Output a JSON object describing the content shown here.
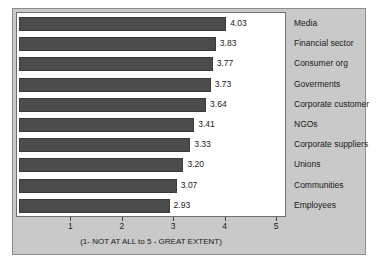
{
  "chart_data": {
    "type": "bar",
    "orientation": "horizontal",
    "title": "",
    "xlabel": "(1- NOT AT ALL to 5 - GREAT EXTENT)",
    "ylabel": "",
    "xlim": [
      0,
      5
    ],
    "xticks": [
      "1",
      "2",
      "3",
      "4",
      "5"
    ],
    "grid": false,
    "legend": null,
    "bar_color": "#4c4c4c",
    "plot_background": "#ffffff",
    "figure_background": "#c9c9c9",
    "categories": [
      "Media",
      "Financial sector",
      "Consumer org",
      "Goverments",
      "Corporate customer",
      "NGOs",
      "Corporate suppliers",
      "Unions",
      "Communities",
      "Employees"
    ],
    "values": [
      4.03,
      3.83,
      3.77,
      3.73,
      3.64,
      3.41,
      3.33,
      3.2,
      3.07,
      2.93
    ],
    "value_labels": [
      "4.03",
      "3.83",
      "3.77",
      "3.73",
      "3.64",
      "3.41",
      "3.33",
      "3.20",
      "3.07",
      "2.93"
    ]
  }
}
